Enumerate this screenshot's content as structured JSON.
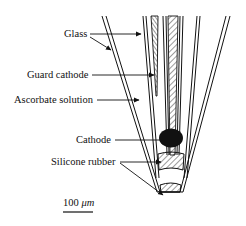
{
  "figure": {
    "type": "schematic cross-section of microelectrode tip",
    "labels": [
      {
        "id": "glass",
        "text": "Glass"
      },
      {
        "id": "guard_cathode",
        "text": "Guard cathode"
      },
      {
        "id": "ascorbate_solution",
        "text": "Ascorbate solution"
      },
      {
        "id": "cathode",
        "text": "Cathode"
      },
      {
        "id": "silicone_rubber",
        "text": "Silicone rubber"
      }
    ],
    "scale_bar": {
      "value": "100",
      "unit": "μm"
    },
    "colors": {
      "line": "#111111",
      "background": "#ffffff",
      "cathode_fill": "#111111"
    }
  }
}
